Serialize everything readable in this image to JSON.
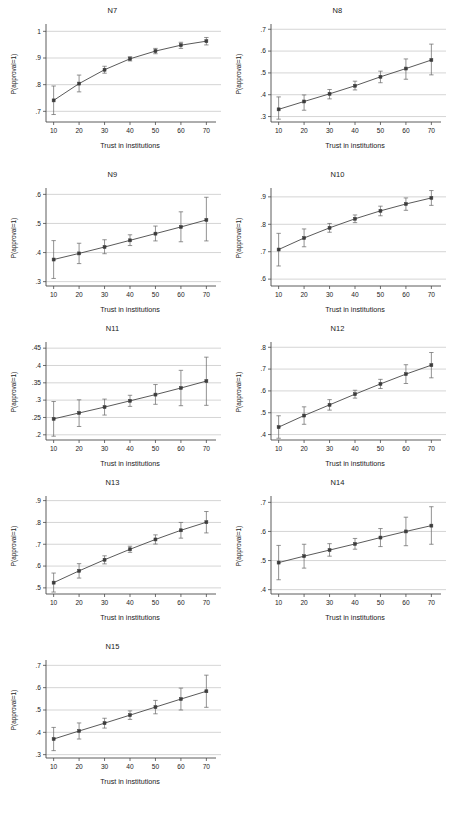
{
  "figure": {
    "panel_count": 9,
    "shared_xlabel": "Trust in institutions",
    "shared_ylabel": "P(approval=1)",
    "x_ticks": [
      "10",
      "20",
      "30",
      "40",
      "50",
      "60",
      "70"
    ]
  },
  "chart_data": [
    {
      "type": "line",
      "title": "N7",
      "xlabel": "Trust in institutions",
      "ylabel": "P(approval=1)",
      "x": [
        10,
        20,
        30,
        40,
        50,
        60,
        70
      ],
      "values": [
        0.741,
        0.804,
        0.856,
        0.897,
        0.926,
        0.948,
        0.963
      ],
      "err_low": [
        0.688,
        0.773,
        0.843,
        0.889,
        0.916,
        0.936,
        0.949
      ],
      "err_high": [
        0.795,
        0.836,
        0.869,
        0.905,
        0.936,
        0.959,
        0.977
      ],
      "ylim": [
        0.66,
        1.02
      ],
      "yticks": [
        0.7,
        0.8,
        0.9,
        1.0
      ],
      "ytick_labels": [
        ".7",
        ".8",
        ".9",
        "1"
      ],
      "xlim": [
        7,
        73
      ],
      "grid": true
    },
    {
      "type": "line",
      "title": "N8",
      "xlabel": "Trust in institutions",
      "ylabel": "P(approval=1)",
      "x": [
        10,
        20,
        30,
        40,
        50,
        60,
        70
      ],
      "values": [
        0.333,
        0.369,
        0.404,
        0.441,
        0.482,
        0.52,
        0.559
      ],
      "err_low": [
        0.288,
        0.329,
        0.381,
        0.422,
        0.455,
        0.471,
        0.491
      ],
      "err_high": [
        0.39,
        0.399,
        0.424,
        0.462,
        0.508,
        0.564,
        0.632
      ],
      "ylim": [
        0.275,
        0.715
      ],
      "yticks": [
        0.3,
        0.4,
        0.5,
        0.6,
        0.7
      ],
      "ytick_labels": [
        ".3",
        ".4",
        ".5",
        ".6",
        ".7"
      ],
      "xlim": [
        7,
        73
      ],
      "grid": true
    },
    {
      "type": "line",
      "title": "N9",
      "xlabel": "Trust in institutions",
      "ylabel": "P(approval=1)",
      "x": [
        10,
        20,
        30,
        40,
        50,
        60,
        70
      ],
      "values": [
        0.376,
        0.397,
        0.419,
        0.442,
        0.465,
        0.488,
        0.512
      ],
      "err_low": [
        0.311,
        0.362,
        0.396,
        0.424,
        0.44,
        0.437,
        0.44
      ],
      "err_high": [
        0.441,
        0.432,
        0.444,
        0.461,
        0.491,
        0.54,
        0.59
      ],
      "ylim": [
        0.285,
        0.615
      ],
      "yticks": [
        0.3,
        0.4,
        0.5,
        0.6
      ],
      "ytick_labels": [
        ".3",
        ".4",
        ".5",
        ".6"
      ],
      "xlim": [
        7,
        73
      ],
      "grid": true
    },
    {
      "type": "line",
      "title": "N10",
      "xlabel": "Trust in institutions",
      "ylabel": "P(approval=1)",
      "x": [
        10,
        20,
        30,
        40,
        50,
        60,
        70
      ],
      "values": [
        0.708,
        0.75,
        0.787,
        0.82,
        0.849,
        0.874,
        0.896
      ],
      "err_low": [
        0.648,
        0.718,
        0.771,
        0.806,
        0.831,
        0.851,
        0.869
      ],
      "err_high": [
        0.767,
        0.783,
        0.803,
        0.834,
        0.866,
        0.896,
        0.923
      ],
      "ylim": [
        0.575,
        0.925
      ],
      "yticks": [
        0.6,
        0.7,
        0.8,
        0.9
      ],
      "ytick_labels": [
        ".6",
        ".7",
        ".8",
        ".9"
      ],
      "xlim": [
        7,
        73
      ],
      "grid": true
    },
    {
      "type": "line",
      "title": "N11",
      "xlabel": "Trust in institutions",
      "ylabel": "P(approval=1)",
      "x": [
        10,
        20,
        30,
        40,
        50,
        60,
        70
      ],
      "values": [
        0.246,
        0.263,
        0.28,
        0.298,
        0.316,
        0.335,
        0.355
      ],
      "err_low": [
        0.196,
        0.224,
        0.257,
        0.282,
        0.288,
        0.284,
        0.285
      ],
      "err_high": [
        0.296,
        0.301,
        0.303,
        0.314,
        0.345,
        0.386,
        0.424
      ],
      "ylim": [
        0.185,
        0.462
      ],
      "yticks": [
        0.2,
        0.25,
        0.3,
        0.35,
        0.4,
        0.45
      ],
      "ytick_labels": [
        ".2",
        ".25",
        ".3",
        ".35",
        ".4",
        ".45"
      ],
      "xlim": [
        7,
        73
      ],
      "grid": true
    },
    {
      "type": "line",
      "title": "N12",
      "xlabel": "Trust in institutions",
      "ylabel": "P(approval=1)",
      "x": [
        10,
        20,
        30,
        40,
        50,
        60,
        70
      ],
      "values": [
        0.434,
        0.487,
        0.536,
        0.585,
        0.632,
        0.677,
        0.718
      ],
      "err_low": [
        0.383,
        0.447,
        0.512,
        0.567,
        0.611,
        0.634,
        0.66
      ],
      "err_high": [
        0.486,
        0.527,
        0.56,
        0.603,
        0.653,
        0.72,
        0.776
      ],
      "ylim": [
        0.375,
        0.815
      ],
      "yticks": [
        0.4,
        0.5,
        0.6,
        0.7,
        0.8
      ],
      "ytick_labels": [
        ".4",
        ".5",
        ".6",
        ".7",
        ".8"
      ],
      "xlim": [
        7,
        73
      ],
      "grid": true
    },
    {
      "type": "line",
      "title": "N13",
      "xlabel": "Trust in institutions",
      "ylabel": "P(approval=1)",
      "x": [
        10,
        20,
        30,
        40,
        50,
        60,
        70
      ],
      "values": [
        0.524,
        0.578,
        0.629,
        0.677,
        0.722,
        0.764,
        0.801
      ],
      "err_low": [
        0.481,
        0.545,
        0.61,
        0.663,
        0.701,
        0.728,
        0.752
      ],
      "err_high": [
        0.568,
        0.611,
        0.647,
        0.691,
        0.743,
        0.8,
        0.85
      ],
      "ylim": [
        0.472,
        0.912
      ],
      "yticks": [
        0.5,
        0.6,
        0.7,
        0.8,
        0.9
      ],
      "ytick_labels": [
        ".5",
        ".6",
        ".7",
        ".8",
        ".9"
      ],
      "xlim": [
        7,
        73
      ],
      "grid": true
    },
    {
      "type": "line",
      "title": "N14",
      "xlabel": "Trust in institutions",
      "ylabel": "P(approval=1)",
      "x": [
        10,
        20,
        30,
        40,
        50,
        60,
        70
      ],
      "values": [
        0.493,
        0.515,
        0.536,
        0.557,
        0.579,
        0.6,
        0.62
      ],
      "err_low": [
        0.434,
        0.474,
        0.515,
        0.539,
        0.548,
        0.551,
        0.556
      ],
      "err_high": [
        0.552,
        0.556,
        0.558,
        0.576,
        0.61,
        0.649,
        0.685
      ],
      "ylim": [
        0.385,
        0.715
      ],
      "yticks": [
        0.4,
        0.5,
        0.6,
        0.7
      ],
      "ytick_labels": [
        ".4",
        ".5",
        ".6",
        ".7"
      ],
      "xlim": [
        7,
        73
      ],
      "grid": true
    },
    {
      "type": "line",
      "title": "N15",
      "xlabel": "Trust in institutions",
      "ylabel": "P(approval=1)",
      "x": [
        10,
        20,
        30,
        40,
        50,
        60,
        70
      ],
      "values": [
        0.37,
        0.406,
        0.441,
        0.477,
        0.513,
        0.549,
        0.584
      ],
      "err_low": [
        0.318,
        0.37,
        0.419,
        0.458,
        0.483,
        0.5,
        0.512
      ],
      "err_high": [
        0.422,
        0.442,
        0.463,
        0.496,
        0.543,
        0.598,
        0.656
      ],
      "ylim": [
        0.285,
        0.715
      ],
      "yticks": [
        0.3,
        0.4,
        0.5,
        0.6,
        0.7
      ],
      "ytick_labels": [
        ".3",
        ".4",
        ".5",
        ".6",
        ".7"
      ],
      "xlim": [
        7,
        73
      ],
      "grid": true
    }
  ]
}
